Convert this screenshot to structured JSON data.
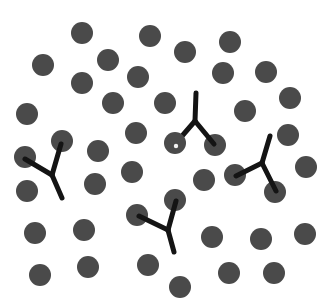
{
  "figure": {
    "background_color": "#ffffff",
    "width": 333,
    "height": 306
  },
  "style": {
    "particle_color": "#4a4a4a",
    "antibody_color": "#141414",
    "bound_marker_color": "#f2f2f2",
    "particle_radius": 11,
    "antibody_stroke_width": 5,
    "bound_marker_radius": 2.2
  },
  "chart_data": {
    "type": "scatter",
    "xlabel": "",
    "ylabel": "",
    "xlim": [
      0,
      333
    ],
    "ylim": [
      0,
      306
    ],
    "grid": false,
    "legend": null,
    "series": [
      {
        "name": "particles",
        "marker": "circle",
        "color": "#4a4a4a",
        "radius": 11,
        "points": [
          {
            "x": 82,
            "y": 33
          },
          {
            "x": 150,
            "y": 36
          },
          {
            "x": 185,
            "y": 52
          },
          {
            "x": 230,
            "y": 42
          },
          {
            "x": 43,
            "y": 65
          },
          {
            "x": 108,
            "y": 60
          },
          {
            "x": 266,
            "y": 72
          },
          {
            "x": 82,
            "y": 83
          },
          {
            "x": 138,
            "y": 77
          },
          {
            "x": 223,
            "y": 73
          },
          {
            "x": 27,
            "y": 114
          },
          {
            "x": 113,
            "y": 103
          },
          {
            "x": 165,
            "y": 103
          },
          {
            "x": 245,
            "y": 111
          },
          {
            "x": 290,
            "y": 98
          },
          {
            "x": 62,
            "y": 141
          },
          {
            "x": 136,
            "y": 133
          },
          {
            "x": 215,
            "y": 145
          },
          {
            "x": 288,
            "y": 135
          },
          {
            "x": 25,
            "y": 157
          },
          {
            "x": 98,
            "y": 151
          },
          {
            "x": 306,
            "y": 167
          },
          {
            "x": 27,
            "y": 191
          },
          {
            "x": 95,
            "y": 184
          },
          {
            "x": 132,
            "y": 172
          },
          {
            "x": 204,
            "y": 180
          },
          {
            "x": 235,
            "y": 175
          },
          {
            "x": 275,
            "y": 192
          },
          {
            "x": 175,
            "y": 200
          },
          {
            "x": 137,
            "y": 215
          },
          {
            "x": 35,
            "y": 233
          },
          {
            "x": 84,
            "y": 230
          },
          {
            "x": 212,
            "y": 237
          },
          {
            "x": 261,
            "y": 239
          },
          {
            "x": 305,
            "y": 234
          },
          {
            "x": 40,
            "y": 275
          },
          {
            "x": 88,
            "y": 267
          },
          {
            "x": 148,
            "y": 265
          },
          {
            "x": 229,
            "y": 273
          },
          {
            "x": 274,
            "y": 273
          },
          {
            "x": 180,
            "y": 287
          }
        ]
      },
      {
        "name": "bound-particles",
        "marker": "circle-with-dot",
        "color": "#4a4a4a",
        "radius": 11,
        "points": [
          {
            "x": 175,
            "y": 143,
            "marker_x": 176,
            "marker_y": 146
          }
        ]
      },
      {
        "name": "antibodies",
        "marker": "y-shape",
        "color": "#141414",
        "shapes": [
          {
            "name": "antibody-left",
            "stem": [
              [
                52,
                175
              ],
              [
                62,
                198
              ]
            ],
            "arm_a": [
              [
                52,
                175
              ],
              [
                25,
                159
              ]
            ],
            "arm_b": [
              [
                52,
                175
              ],
              [
                61,
                144
              ]
            ]
          },
          {
            "name": "antibody-center",
            "stem": [
              [
                195,
                121
              ],
              [
                196,
                93
              ]
            ],
            "arm_a": [
              [
                195,
                121
              ],
              [
                176,
                143
              ]
            ],
            "arm_b": [
              [
                195,
                121
              ],
              [
                214,
                144
              ]
            ]
          },
          {
            "name": "antibody-right",
            "stem": [
              [
                262,
                163
              ],
              [
                270,
                136
              ]
            ],
            "arm_a": [
              [
                262,
                163
              ],
              [
                236,
                176
              ]
            ],
            "arm_b": [
              [
                262,
                163
              ],
              [
                276,
                191
              ]
            ]
          },
          {
            "name": "antibody-bottom",
            "stem": [
              [
                168,
                230
              ],
              [
                174,
                252
              ]
            ],
            "arm_a": [
              [
                168,
                230
              ],
              [
                139,
                216
              ]
            ],
            "arm_b": [
              [
                168,
                230
              ],
              [
                176,
                201
              ]
            ]
          }
        ]
      }
    ]
  }
}
